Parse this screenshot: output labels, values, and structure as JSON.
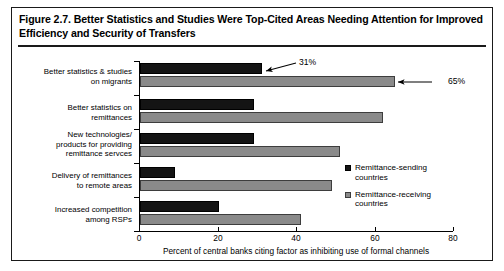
{
  "figure": {
    "title": "Figure 2.7. Better Statistics and Studies Were Top-Cited Areas Needing Attention for Improved Efficiency and Security of Transfers"
  },
  "chart_data": {
    "type": "bar",
    "orientation": "horizontal",
    "title": "Figure 2.7. Better Statistics and Studies Were Top-Cited Areas Needing Attention for Improved Efficiency and Security of Transfers",
    "xlabel": "Percent of central banks citing factor as inhibiting use of formal channels",
    "ylabel": "",
    "xlim": [
      0,
      80
    ],
    "xticks": [
      0,
      20,
      40,
      60,
      80
    ],
    "xtick_labels": [
      "0",
      "20",
      "40",
      "60",
      "80"
    ],
    "grid": false,
    "legend_position": "right",
    "categories": [
      "Better statistics & studies on migrants",
      "Better statistics on remittances",
      "New technologies/ products for providing remittance services",
      "Delivery of remittances to remote areas",
      "Increased competition among RSPs"
    ],
    "category_lines": [
      [
        "Better statistics & studies",
        "on migrants"
      ],
      [
        "Better statistics on",
        "remittances"
      ],
      [
        "New technologies/",
        "products for providing",
        "remittance servces"
      ],
      [
        "Delivery of remittances",
        "to remote areas"
      ],
      [
        "Increased competition",
        "among RSPs"
      ]
    ],
    "series": [
      {
        "name": "Remittance-sending countries",
        "color": "#141414",
        "values": [
          31,
          29,
          29,
          9,
          20
        ]
      },
      {
        "name": "Remittance-receiving countries",
        "color": "#8a8a8a",
        "values": [
          65,
          62,
          51,
          49,
          41
        ]
      }
    ],
    "annotations": [
      {
        "text": "31%",
        "series": "Remittance-sending countries",
        "category_index": 0,
        "value": 31
      },
      {
        "text": "65%",
        "series": "Remittance-receiving countries",
        "category_index": 0,
        "value": 65
      }
    ]
  },
  "legend": {
    "items": [
      {
        "label_line1": "Remittance-sending",
        "label_line2": "countries",
        "color": "#141414"
      },
      {
        "label_line1": "Remittance-receiving",
        "label_line2": "countries",
        "color": "#8a8a8a"
      }
    ]
  },
  "axis": {
    "x_title": "Percent of central banks citing factor as inhibiting use of formal channels",
    "tick_0": "0",
    "tick_1": "20",
    "tick_2": "40",
    "tick_3": "60",
    "tick_4": "80"
  },
  "annotations": {
    "a0": "31%",
    "a1": "65%"
  }
}
